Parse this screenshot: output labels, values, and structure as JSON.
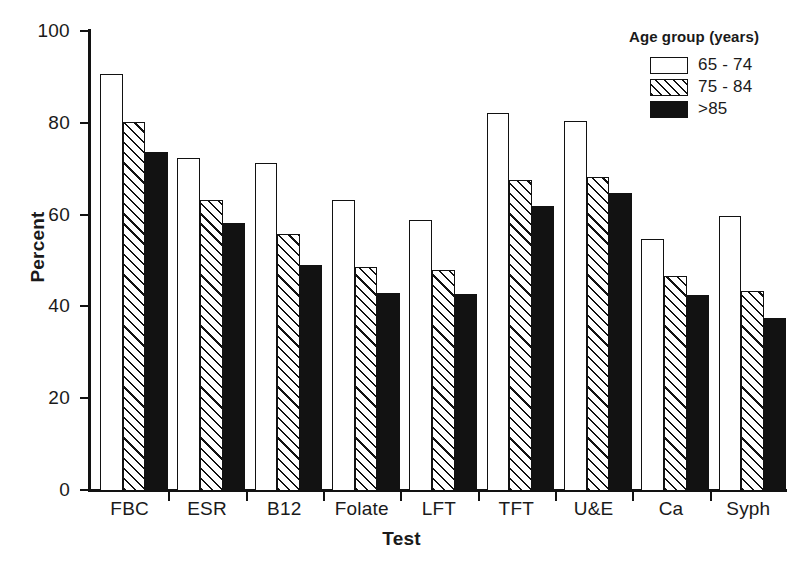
{
  "chart_data": {
    "type": "bar",
    "title": "",
    "xlabel": "Test",
    "ylabel": "Percent",
    "ylim": [
      0,
      100
    ],
    "yticks": [
      "0",
      "20",
      "40",
      "60",
      "80",
      "100"
    ],
    "grid": false,
    "legend_position": "top-right",
    "legend_title": "Age group (years)",
    "categories": [
      "FBC",
      "ESR",
      "B12",
      "Folate",
      "LFT",
      "TFT",
      "U&E",
      "Ca",
      "Syph"
    ],
    "series": [
      {
        "name": "65 - 74",
        "fill": "open",
        "values": [
          90.8,
          72.5,
          71.5,
          63.3,
          59.0,
          82.3,
          80.6,
          54.8,
          60.0
        ]
      },
      {
        "name": "75 - 84",
        "fill": "hatch",
        "values": [
          80.5,
          63.5,
          56.0,
          48.7,
          48.1,
          67.7,
          68.5,
          46.8,
          43.5
        ]
      },
      {
        "name": ">85",
        "fill": "solid",
        "values": [
          73.8,
          58.3,
          49.2,
          43.2,
          43.0,
          62.2,
          65.0,
          42.6,
          37.8
        ]
      }
    ],
    "colors": {
      "axis": "#121212",
      "bar_outline": "#121212",
      "bar_open_fill": "#ffffff",
      "bar_solid_fill": "#121212",
      "background": "#ffffff"
    }
  }
}
